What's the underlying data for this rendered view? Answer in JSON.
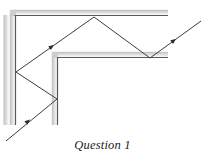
{
  "figure": {
    "caption": "Question 1",
    "type": "optics-ray-diagram",
    "width": 205,
    "height": 162,
    "background_color": "#ffffff",
    "mirror_line_color": "#595959",
    "mirror_shadow_color": "#c9c9c9",
    "ray_color": "#3d3d3d",
    "ray_stroke_width": 1.0,
    "mirror_stroke_width": 1.2
  },
  "chart_data": {
    "type": "line",
    "title": "Question 1",
    "xlabel": "",
    "ylabel": "",
    "xlim": [
      0,
      205
    ],
    "ylim": [
      162,
      0
    ],
    "grid": false,
    "legend": null,
    "series": [
      {
        "name": "outer-mirror-vertical",
        "role": "mirror",
        "points": [
          [
            15.5,
            15.0
          ],
          [
            15.5,
            125.0
          ]
        ]
      },
      {
        "name": "outer-mirror-horizontal",
        "role": "mirror",
        "points": [
          [
            14.5,
            15.5
          ],
          [
            168.0,
            15.5
          ]
        ]
      },
      {
        "name": "inner-mirror-vertical",
        "role": "mirror",
        "points": [
          [
            57.5,
            57.0
          ],
          [
            57.5,
            125.0
          ]
        ]
      },
      {
        "name": "inner-mirror-horizontal",
        "role": "mirror",
        "points": [
          [
            57.0,
            57.5
          ],
          [
            168.0,
            57.5
          ]
        ]
      },
      {
        "name": "light-ray-path",
        "role": "ray",
        "points": [
          [
            6.0,
            141.0
          ],
          [
            57.0,
            99.0
          ],
          [
            16.0,
            72.0
          ],
          [
            94.0,
            17.0
          ],
          [
            150.0,
            58.0
          ],
          [
            201.0,
            21.0
          ]
        ]
      }
    ],
    "annotations": [
      {
        "name": "arrow-incoming-ray",
        "x": 30.0,
        "y": 119.5,
        "angle_deg": -39.5
      },
      {
        "name": "arrow-ascending-ray",
        "x": 54.0,
        "y": 45.0,
        "angle_deg": -35.0
      },
      {
        "name": "arrow-outgoing-ray",
        "x": 176.0,
        "y": 39.0,
        "angle_deg": -36.0
      }
    ]
  },
  "ray_vertices": {
    "entry_point": [
      6,
      141
    ],
    "reflection_inner_vertical": [
      57,
      99
    ],
    "reflection_outer_vertical": [
      16,
      72
    ],
    "reflection_outer_horizontal": [
      94,
      17
    ],
    "reflection_inner_horizontal": [
      150,
      58
    ],
    "exit_point": [
      201,
      21
    ]
  }
}
